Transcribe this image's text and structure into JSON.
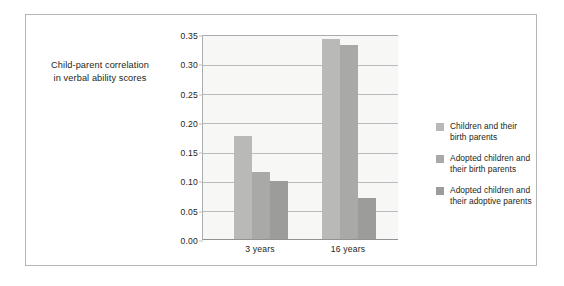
{
  "chart_data": {
    "type": "bar",
    "title": "",
    "xlabel": "",
    "ylabel": "Child-parent correlation in verbal ability scores",
    "ylabel_lines": [
      "Child-parent correlation",
      "in verbal ability scores"
    ],
    "categories": [
      "3 years",
      "16 years"
    ],
    "series": [
      {
        "name": "Children and their birth parents",
        "name_lines": [
          "Children and their",
          "birth parents"
        ],
        "color": "#b9b9b7",
        "values": [
          0.175,
          0.34
        ]
      },
      {
        "name": "Adopted children and their birth parents",
        "name_lines": [
          "Adopted children and",
          "their birth parents"
        ],
        "color": "#a9a9a7",
        "values": [
          0.113,
          0.33
        ]
      },
      {
        "name": "Adopted children and their adoptive parents",
        "name_lines": [
          "Adopted children and",
          "their adoptive parents"
        ],
        "color": "#9c9c9a",
        "values": [
          0.098,
          0.07
        ]
      }
    ],
    "ylim": [
      0.0,
      0.35
    ],
    "yticks": [
      "0.00",
      "0.05",
      "0.10",
      "0.15",
      "0.20",
      "0.25",
      "0.30",
      "0.35"
    ],
    "ytick_values": [
      0.0,
      0.05,
      0.1,
      0.15,
      0.2,
      0.25,
      0.3,
      0.35
    ],
    "grid": true,
    "legend_position": "right",
    "plot_background": "#f7f7f5",
    "grid_color": "#b9bdbf",
    "frame_color": "#b3b7ba",
    "text_color": "#231f20"
  }
}
